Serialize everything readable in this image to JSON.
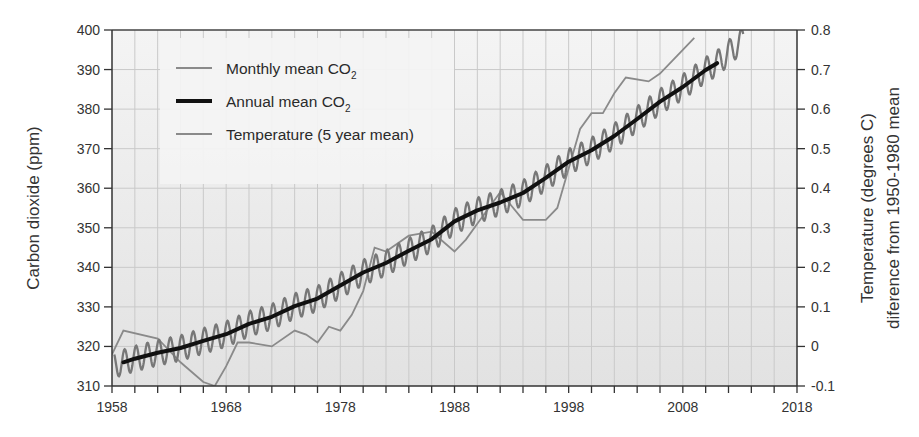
{
  "chart_data": {
    "type": "line",
    "title": "",
    "xlabel": "",
    "ylabel": "Carbon dioxide (ppm)",
    "y2label_line1": "Temperature (degrees C)",
    "y2label_line2": "diference  from 1950-1980 mean",
    "xlim": [
      1958,
      2018
    ],
    "ylim": [
      310,
      400
    ],
    "y2lim": [
      -0.1,
      0.8
    ],
    "x_ticks": [
      "1958",
      "1968",
      "1978",
      "1988",
      "1998",
      "2008",
      "2018"
    ],
    "y_ticks": [
      "310",
      "320",
      "330",
      "340",
      "350",
      "360",
      "370",
      "380",
      "390",
      "400"
    ],
    "y2_ticks": [
      "-0.1",
      "0",
      "0.1",
      "0.2",
      "0.3",
      "0.4",
      "0.5",
      "0.6",
      "0.7",
      "0.8"
    ],
    "grid": true,
    "legend_position": "upper-left",
    "legend": [
      {
        "label": "Monthly mean CO",
        "sub": "2",
        "style": "thin-gray"
      },
      {
        "label": "Annual  mean  CO",
        "sub": "2",
        "style": "thick-black"
      },
      {
        "label": "Temperature (5 year mean)",
        "style": "thin-gray"
      }
    ],
    "series": [
      {
        "name": "Annual mean CO2",
        "axis": "left",
        "color": "#111111",
        "x": [
          1959,
          1960,
          1962,
          1964,
          1966,
          1968,
          1970,
          1972,
          1974,
          1976,
          1978,
          1980,
          1982,
          1984,
          1986,
          1988,
          1990,
          1992,
          1994,
          1996,
          1998,
          2000,
          2002,
          2004,
          2006,
          2008,
          2010,
          2011
        ],
        "values": [
          316,
          316.9,
          318.4,
          319.6,
          321.4,
          323.1,
          325.7,
          327.5,
          330.2,
          332.1,
          335.4,
          338.7,
          341.1,
          344.2,
          347.1,
          351.6,
          354.4,
          356.4,
          358.8,
          362.6,
          366.7,
          369.6,
          373.2,
          377.5,
          381.9,
          385.6,
          389.9,
          391.6
        ]
      },
      {
        "name": "Monthly mean CO2 (seasonal amplitude ~±3 ppm around annual mean)",
        "axis": "left",
        "color": "#777777",
        "x_start": 1958.2,
        "x_end": 2013.3,
        "seasonal_amplitude_ppm": 3.2,
        "end_value": 400
      },
      {
        "name": "Temperature (5 year mean)",
        "axis": "right",
        "color": "#8a8a8a",
        "x": [
          1958,
          1959,
          1962,
          1964,
          1966,
          1967,
          1968,
          1969,
          1970,
          1972,
          1974,
          1975,
          1976,
          1977,
          1978,
          1979,
          1980,
          1981,
          1982,
          1984,
          1986,
          1988,
          1989,
          1990,
          1991,
          1992,
          1994,
          1995,
          1996,
          1997,
          1998,
          1999,
          2000,
          2001,
          2002,
          2003,
          2005,
          2006,
          2008,
          2009
        ],
        "values": [
          -0.02,
          0.04,
          0.02,
          -0.04,
          -0.09,
          -0.1,
          -0.05,
          0.01,
          0.01,
          0.0,
          0.04,
          0.03,
          0.01,
          0.05,
          0.04,
          0.08,
          0.14,
          0.25,
          0.24,
          0.28,
          0.29,
          0.24,
          0.27,
          0.31,
          0.35,
          0.39,
          0.32,
          0.32,
          0.32,
          0.35,
          0.45,
          0.55,
          0.59,
          0.59,
          0.64,
          0.68,
          0.67,
          0.69,
          0.75,
          0.78
        ]
      }
    ]
  }
}
